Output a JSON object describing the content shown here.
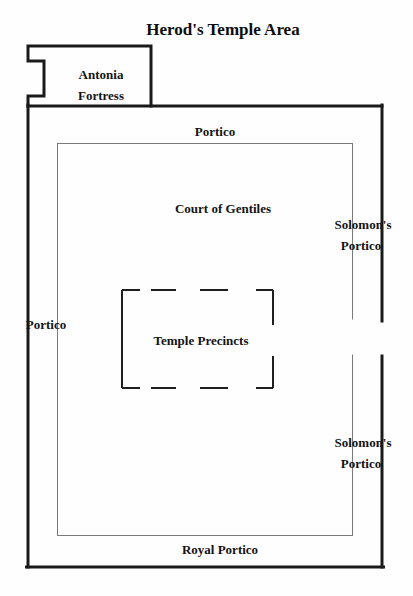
{
  "title": "Herod's Temple Area",
  "labels": {
    "antonia_fortress": [
      "Antonia",
      "Fortress"
    ],
    "portico_top": "Portico",
    "court_of_gentiles": "Court of Gentiles",
    "solomons_portico_upper": [
      "Solomon's",
      "Portico"
    ],
    "portico_left": "Portico",
    "temple_precincts": "Temple Precincts",
    "solomons_portico_lower": [
      "Solomon's",
      "Portico"
    ],
    "royal_portico": "Royal Portico"
  },
  "colors": {
    "outer_wall": "#1a1a1a",
    "inner_wall": "#7a7a7a",
    "precinct_boundary": "#1f1f1f",
    "text": "#141414",
    "background": "#fefefe"
  }
}
